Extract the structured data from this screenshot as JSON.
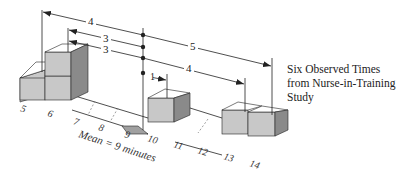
{
  "caption": {
    "lines": [
      "Six Observed Times",
      "from Nurse-in-Training",
      "Study"
    ]
  },
  "axis": {
    "ticks": [
      "5",
      "6",
      "7",
      "8",
      "9",
      "10",
      "11",
      "12",
      "13",
      "14"
    ],
    "mean_label": "Mean = 9 minutes"
  },
  "observations": [
    5,
    6,
    6,
    10,
    13,
    14
  ],
  "deviations": [
    {
      "from": 5,
      "label": "4"
    },
    {
      "from": 6,
      "label": "3"
    },
    {
      "from": 6,
      "label": "3"
    },
    {
      "from": 10,
      "label": "1"
    },
    {
      "from": 13,
      "label": "4"
    },
    {
      "from": 14,
      "label": "5"
    }
  ],
  "colors": {
    "block_front": "#c8c8c8",
    "block_top": "#ffffff",
    "block_side": "#8a8a8a",
    "line": "#222222",
    "axis_dash": "#777777",
    "fulcrum": "#a0a0a0"
  }
}
